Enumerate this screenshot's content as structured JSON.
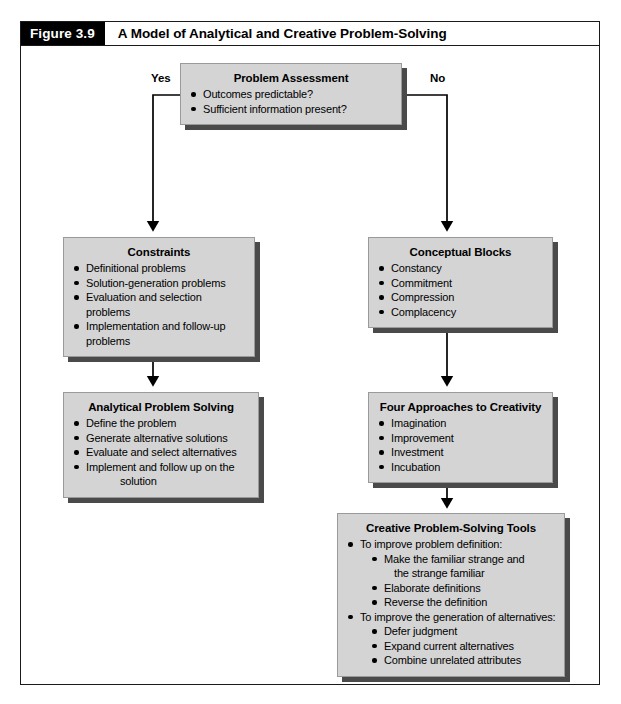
{
  "figure": {
    "number_label": "Figure 3.9",
    "title": "A Model of Analytical and Creative Problem-Solving"
  },
  "branches": {
    "yes_label": "Yes",
    "no_label": "No"
  },
  "nodes": {
    "problem_assessment": {
      "title": "Problem Assessment",
      "items": [
        "Outcomes predictable?",
        "Sufficient information present?"
      ]
    },
    "constraints": {
      "title": "Constraints",
      "items": [
        "Definitional problems",
        "Solution-generation problems",
        "Evaluation and selection problems",
        "Implementation and follow-up problems"
      ]
    },
    "conceptual_blocks": {
      "title": "Conceptual Blocks",
      "items": [
        "Constancy",
        "Commitment",
        "Compression",
        "Complacency"
      ]
    },
    "analytical_problem_solving": {
      "title": "Analytical Problem Solving",
      "items": [
        "Define the problem",
        "Generate alternative solutions",
        "Evaluate and select alternatives",
        "Implement and follow up on the"
      ],
      "item_4_continuation": "solution"
    },
    "four_approaches": {
      "title": "Four Approaches to Creativity",
      "items": [
        "Imagination",
        "Improvement",
        "Investment",
        "Incubation"
      ]
    },
    "creative_tools": {
      "title": "Creative Problem-Solving Tools",
      "items": [
        "To improve problem definition:",
        "Make the familiar strange and",
        "the strange familiar",
        "Elaborate definitions",
        "Reverse the definition",
        "To improve the generation of alternatives:",
        "Defer judgment",
        "Expand current alternatives",
        "Combine unrelated attributes"
      ]
    }
  },
  "colors": {
    "box_fill": "#d4d4d4",
    "box_shadow": "#4a4a4a",
    "frame_line": "#1a1a1a",
    "header_bar": "#000000",
    "connector": "#000000"
  }
}
